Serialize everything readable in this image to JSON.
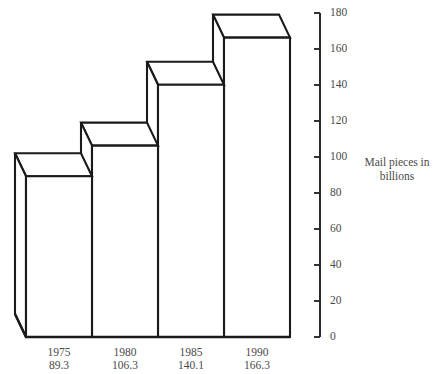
{
  "chart_data": {
    "type": "bar",
    "title": "",
    "subtitle": "",
    "xlabel": "",
    "ylabel": "Mail pieces in billions",
    "ylabel_lines": [
      "Mail pieces in",
      "billions"
    ],
    "categories": [
      "1975",
      "1980",
      "1985",
      "1990"
    ],
    "values": [
      89.3,
      106.3,
      140.1,
      166.3
    ],
    "value_labels": [
      "89.3",
      "106.3",
      "140.1",
      "166.3"
    ],
    "ylim": [
      0,
      180
    ],
    "ytick_step": 20,
    "yticks": [
      0,
      20,
      40,
      60,
      80,
      100,
      120,
      140,
      160,
      180
    ],
    "ytick_labels": [
      "0",
      "20",
      "40",
      "60",
      "80",
      "100",
      "120",
      "140",
      "160",
      "180"
    ],
    "grid": false,
    "legend": false,
    "legend_position": "none",
    "style": "3d-isometric-outline",
    "colors": {
      "bar_fill": "#ffffff",
      "bar_outline": "#1a1a1a",
      "axis": "#2a2a2a",
      "text": "#4a4a4a",
      "background": "#ffffff"
    },
    "annotations": []
  },
  "geometry": {
    "baseline_y": 337,
    "axis_top_y": 13,
    "axis_x": 320,
    "tick_length": 6,
    "bar_left_x": 26,
    "bar_width": 66,
    "depth_dx": -11,
    "depth_dy": -23,
    "px_per_unit": 1.8
  }
}
